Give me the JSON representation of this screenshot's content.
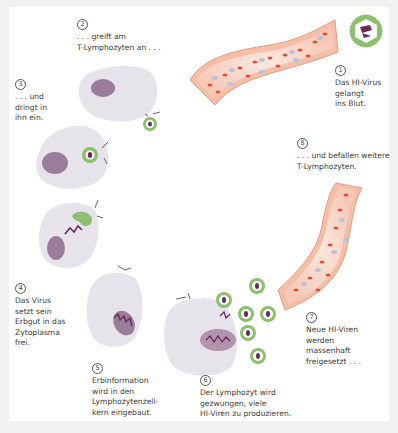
{
  "figure": {
    "colors": {
      "background": "#ffffff",
      "frame": "#f1f1f1",
      "cell_fill": "#e7e3ea",
      "nucleus": "#9a7d98",
      "virus_ring": "#8cbf6e",
      "virus_core": "#6a2a5a",
      "vessel_wall": "#f2b9a2",
      "vessel_inner": "#fbe3d9",
      "red_cell": "#e0523a",
      "white_cell": "#b8bed8"
    },
    "steps": [
      {
        "number": "1",
        "lines": [
          "Das HI-Virus",
          "gelangt",
          "ins Blut."
        ]
      },
      {
        "number": "2",
        "lines": [
          ". . . greift am",
          "T-Lymphozyten an . . ."
        ]
      },
      {
        "number": "3",
        "lines": [
          ". . . und",
          "dringt in",
          "ihn ein."
        ]
      },
      {
        "number": "4",
        "lines": [
          "Das Virus",
          "setzt sein",
          "Erbgut in das",
          "Zytoplasma",
          "frei."
        ]
      },
      {
        "number": "5",
        "lines": [
          "Erbinformation",
          "wird in den",
          "Lymphozytenzell-",
          "kern eingebaut."
        ]
      },
      {
        "number": "6",
        "lines": [
          "Der Lymphozyt wird",
          "gezwungen, viele",
          "HI-Viren zu produzieren."
        ]
      },
      {
        "number": "7",
        "lines": [
          "Neue HI-Viren",
          "werden",
          "massenhaft",
          "freigesetzt . . ."
        ]
      },
      {
        "number": "8",
        "lines": [
          ". . . und befallen weitere",
          "T-Lymphozyten."
        ]
      }
    ]
  }
}
